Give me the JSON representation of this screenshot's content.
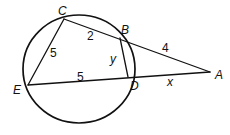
{
  "diagram": {
    "type": "circle-secant-geometry",
    "circle": {
      "cx": 79,
      "cy": 69,
      "rx": 56,
      "ry": 54
    },
    "points": {
      "A": {
        "label": "A",
        "x": 210,
        "y": 72,
        "label_x": 215,
        "label_y": 79
      },
      "B": {
        "label": "B",
        "x": 120,
        "y": 38,
        "label_x": 121,
        "label_y": 34
      },
      "C": {
        "label": "C",
        "x": 64,
        "y": 19,
        "label_x": 58,
        "label_y": 15
      },
      "D": {
        "label": "D",
        "x": 128,
        "y": 77,
        "label_x": 130,
        "label_y": 90
      },
      "E": {
        "label": "E",
        "x": 28,
        "y": 85,
        "label_x": 13,
        "label_y": 94
      }
    },
    "segments": [
      {
        "name": "segment-CE",
        "from": "C",
        "to": "E"
      },
      {
        "name": "segment-CA",
        "from": "C",
        "to": "A"
      },
      {
        "name": "segment-BD",
        "from": "B",
        "to": "D"
      },
      {
        "name": "segment-EA",
        "from": "E",
        "to": "A"
      }
    ],
    "measures": {
      "CE": {
        "text": "5",
        "x": 50,
        "y": 57
      },
      "CB": {
        "text": "2",
        "x": 87,
        "y": 40
      },
      "BA": {
        "text": "4",
        "x": 162,
        "y": 52
      },
      "BD": {
        "text": "y",
        "x": 110,
        "y": 63
      },
      "ED": {
        "text": "5",
        "x": 77,
        "y": 81
      },
      "DA": {
        "text": "x",
        "x": 167,
        "y": 86
      }
    },
    "colors": {
      "stroke": "#111111",
      "background": "#ffffff"
    }
  }
}
